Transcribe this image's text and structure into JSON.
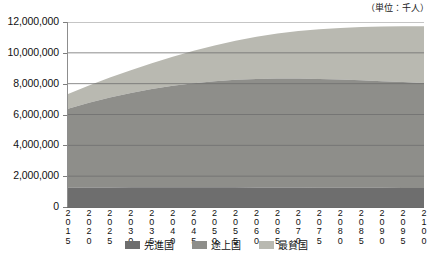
{
  "unit_note": "（単位：千人）",
  "legend": {
    "position": "bottom-center",
    "items": [
      {
        "label": "先進国",
        "color": "#6e6e6e"
      },
      {
        "label": "途上国",
        "color": "#8e8e8a"
      },
      {
        "label": "最貧国",
        "color": "#b9b9b1"
      }
    ]
  },
  "axes": {
    "y": {
      "min": 0,
      "max": 12000000,
      "step": 2000000,
      "ticks": [
        "0",
        "2,000,000",
        "4,000,000",
        "6,000,000",
        "8,000,000",
        "10,000,000",
        "12,000,000"
      ]
    },
    "x": {
      "ticks": [
        "2015",
        "2020",
        "2025",
        "2030",
        "2035",
        "2040",
        "2045",
        "2050",
        "2055",
        "2060",
        "2065",
        "2070",
        "2075",
        "2080",
        "2085",
        "2090",
        "2095",
        "2100"
      ]
    }
  },
  "chart_data": {
    "type": "area",
    "stacked": true,
    "title": "",
    "subtitle": "",
    "xlabel": "",
    "ylabel": "",
    "unit": "千人",
    "grid": true,
    "legend_position": "bottom-center",
    "ylim": [
      0,
      12000000
    ],
    "ytick_step": 2000000,
    "categories": [
      "2015",
      "2020",
      "2025",
      "2030",
      "2035",
      "2040",
      "2045",
      "2050",
      "2055",
      "2060",
      "2065",
      "2070",
      "2075",
      "2080",
      "2085",
      "2090",
      "2095",
      "2100"
    ],
    "series": [
      {
        "name": "先進国",
        "color": "#6e6e6e",
        "values": [
          1255000,
          1265000,
          1272000,
          1277000,
          1280000,
          1281000,
          1280000,
          1278000,
          1275000,
          1271000,
          1266000,
          1261000,
          1256000,
          1251000,
          1247000,
          1243000,
          1240000,
          1237000
        ]
      },
      {
        "name": "途上国",
        "color": "#8e8e8a",
        "values": [
          5125000,
          5495000,
          5830000,
          6120000,
          6370000,
          6580000,
          6750000,
          6880000,
          6975000,
          7035000,
          7065000,
          7070000,
          7050000,
          7015000,
          6970000,
          6918000,
          6865000,
          6813000
        ]
      },
      {
        "name": "最貧国",
        "color": "#b9b9b1",
        "values": [
          955000,
          1115000,
          1290000,
          1480000,
          1680000,
          1890000,
          2105000,
          2320000,
          2530000,
          2730000,
          2915000,
          3080000,
          3225000,
          3350000,
          3455000,
          3545000,
          3620000,
          3680000
        ]
      }
    ],
    "cumulative_totals": [
      7335000,
      7875000,
      8392000,
      8877000,
      9330000,
      9751000,
      10135000,
      10478000,
      10780000,
      11036000,
      11246000,
      11411000,
      11531000,
      11616000,
      11672000,
      11706000,
      11725000,
      11730000
    ]
  }
}
